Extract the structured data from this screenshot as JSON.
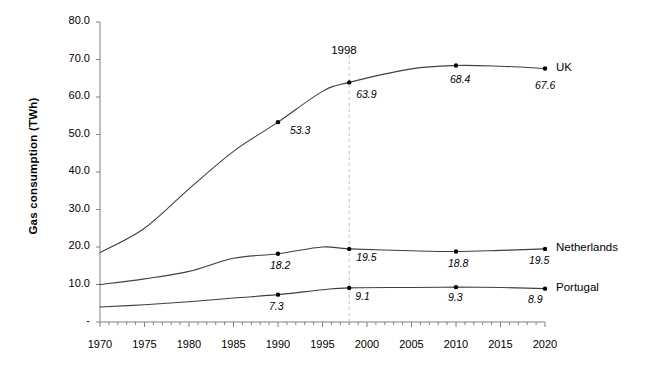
{
  "chart_data": {
    "type": "line",
    "title": "",
    "xlabel": "",
    "ylabel": "Gas consumption (TWh)",
    "xlim": [
      1970,
      2020
    ],
    "ylim": [
      0,
      80
    ],
    "grid": false,
    "legend_position": "right-of-line-ends",
    "x_ticks": [
      "1970",
      "1975",
      "1980",
      "1985",
      "1990",
      "1995",
      "2000",
      "2005",
      "2010",
      "2015",
      "2020"
    ],
    "x_tick_values": [
      1970,
      1975,
      1980,
      1985,
      1990,
      1995,
      2000,
      2005,
      2010,
      2015,
      2020
    ],
    "x_minor_tick_interval": 1,
    "y_ticks": [
      "-",
      "10.0",
      "20.0",
      "30.0",
      "40.0",
      "50.0",
      "60.0",
      "70.0",
      "80.0"
    ],
    "y_tick_values": [
      0,
      10,
      20,
      30,
      40,
      50,
      60,
      70,
      80
    ],
    "annotations": [
      {
        "name": "year-1998-marker",
        "text": "1998",
        "x": 1998,
        "line": "vertical-dashed",
        "color": "#bfbfbf"
      }
    ],
    "series": [
      {
        "name": "UK",
        "color": "#404040",
        "x": [
          1970,
          1975,
          1980,
          1985,
          1990,
          1995,
          1998,
          2005,
          2010,
          2015,
          2020
        ],
        "values": [
          18.5,
          25.0,
          35.5,
          45.5,
          53.3,
          61.5,
          63.9,
          67.5,
          68.4,
          68.2,
          67.6
        ],
        "labeled_points": [
          {
            "x": 1990,
            "value": 53.3,
            "label": "53.3"
          },
          {
            "x": 1998,
            "value": 63.9,
            "label": "63.9"
          },
          {
            "x": 2010,
            "value": 68.4,
            "label": "68.4"
          },
          {
            "x": 2020,
            "value": 67.6,
            "label": "67.6"
          }
        ]
      },
      {
        "name": "Netherlands",
        "color": "#404040",
        "x": [
          1970,
          1975,
          1980,
          1985,
          1990,
          1995,
          1998,
          2005,
          2010,
          2015,
          2020
        ],
        "values": [
          10.0,
          11.5,
          13.5,
          17.0,
          18.2,
          20.0,
          19.5,
          19.0,
          18.8,
          19.1,
          19.5
        ],
        "labeled_points": [
          {
            "x": 1990,
            "value": 18.2,
            "label": "18.2"
          },
          {
            "x": 1998,
            "value": 19.5,
            "label": "19.5"
          },
          {
            "x": 2010,
            "value": 18.8,
            "label": "18.8"
          },
          {
            "x": 2020,
            "value": 19.5,
            "label": "19.5"
          }
        ]
      },
      {
        "name": "Portugal",
        "color": "#404040",
        "x": [
          1970,
          1975,
          1980,
          1985,
          1990,
          1995,
          1998,
          2005,
          2010,
          2015,
          2020
        ],
        "values": [
          4.0,
          4.6,
          5.4,
          6.4,
          7.3,
          8.6,
          9.1,
          9.2,
          9.3,
          9.2,
          8.9
        ],
        "labeled_points": [
          {
            "x": 1990,
            "value": 7.3,
            "label": "7.3"
          },
          {
            "x": 1998,
            "value": 9.1,
            "label": "9.1"
          },
          {
            "x": 2010,
            "value": 9.3,
            "label": "9.3"
          },
          {
            "x": 2020,
            "value": 8.9,
            "label": "8.9"
          }
        ]
      }
    ]
  },
  "axis": {
    "y_title": "Gas consumption (TWh)"
  },
  "colors": {
    "line": "#404040",
    "axis": "#808080",
    "marker": "#000000",
    "annotation_line": "#bfbfbf",
    "text": "#000000",
    "background": "#ffffff"
  }
}
